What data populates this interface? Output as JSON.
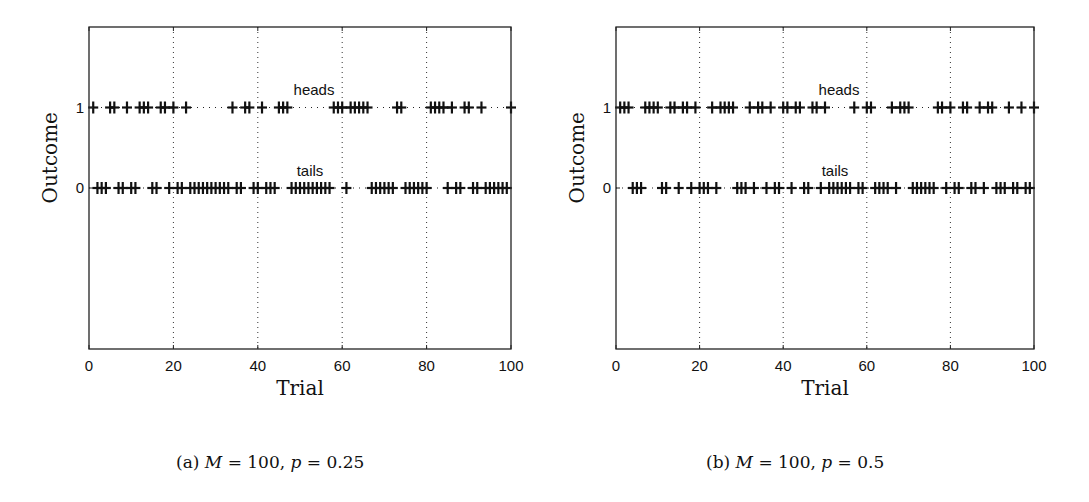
{
  "chart_data": [
    {
      "type": "scatter",
      "panel": "a",
      "caption_prefix": "(a)",
      "caption_M": "M = 100,",
      "caption_p": "p = 0.25",
      "xlabel": "Trial",
      "ylabel": "Outcome",
      "xlim": [
        0,
        100
      ],
      "ylim": [
        -2,
        2
      ],
      "xticks": [
        0,
        20,
        40,
        60,
        80,
        100
      ],
      "yticks": [
        0,
        1
      ],
      "grid": "vertical dotted at x ticks",
      "marker": "+",
      "row_labels": {
        "heads": "heads",
        "tails": "tails"
      },
      "series": [
        {
          "name": "heads",
          "y": 1,
          "x": [
            1,
            5,
            6,
            9,
            12,
            13,
            14,
            17,
            18,
            20,
            23,
            34,
            37,
            38,
            41,
            45,
            46,
            47,
            58,
            59,
            60,
            62,
            63,
            64,
            65,
            66,
            73,
            74,
            81,
            82,
            83,
            84,
            86,
            89,
            90,
            93,
            100
          ]
        },
        {
          "name": "tails",
          "y": 0,
          "x": [
            2,
            3,
            4,
            7,
            8,
            10,
            11,
            15,
            16,
            19,
            21,
            22,
            24,
            25,
            26,
            27,
            28,
            29,
            30,
            31,
            32,
            33,
            35,
            36,
            39,
            40,
            42,
            43,
            44,
            48,
            49,
            50,
            51,
            52,
            53,
            54,
            55,
            56,
            57,
            61,
            67,
            68,
            69,
            70,
            71,
            72,
            75,
            76,
            77,
            78,
            79,
            80,
            85,
            87,
            88,
            91,
            92,
            94,
            95,
            96,
            97,
            98,
            99
          ]
        }
      ]
    },
    {
      "type": "scatter",
      "panel": "b",
      "caption_prefix": "(b)",
      "caption_M": "M = 100,",
      "caption_p": "p = 0.5",
      "xlabel": "Trial",
      "ylabel": "Outcome",
      "xlim": [
        0,
        100
      ],
      "ylim": [
        -2,
        2
      ],
      "xticks": [
        0,
        20,
        40,
        60,
        80,
        100
      ],
      "yticks": [
        0,
        1
      ],
      "grid": "vertical dotted at x ticks",
      "marker": "+",
      "row_labels": {
        "heads": "heads",
        "tails": "tails"
      },
      "series": [
        {
          "name": "heads",
          "y": 1,
          "x": [
            1,
            2,
            3,
            7,
            8,
            9,
            10,
            13,
            14,
            16,
            17,
            19,
            23,
            25,
            26,
            27,
            28,
            32,
            34,
            35,
            37,
            40,
            41,
            43,
            44,
            47,
            48,
            50,
            57,
            60,
            61,
            66,
            68,
            69,
            70,
            77,
            78,
            80,
            83,
            84,
            87,
            89,
            90,
            94,
            97,
            100
          ]
        },
        {
          "name": "tails",
          "y": 0,
          "x": [
            4,
            5,
            6,
            11,
            12,
            15,
            18,
            20,
            21,
            22,
            24,
            29,
            30,
            31,
            33,
            36,
            38,
            39,
            42,
            45,
            46,
            49,
            51,
            52,
            53,
            54,
            55,
            56,
            58,
            59,
            62,
            63,
            64,
            65,
            67,
            71,
            72,
            73,
            74,
            75,
            76,
            79,
            81,
            82,
            85,
            86,
            88,
            91,
            92,
            93,
            95,
            96,
            98,
            99
          ]
        }
      ]
    }
  ],
  "captions": {
    "a": {
      "prefix": "(a)",
      "m_var": "M",
      "m_val": " = 100, ",
      "p_var": "p",
      "p_val": " = 0.25"
    },
    "b": {
      "prefix": "(b)",
      "m_var": "M",
      "m_val": " = 100, ",
      "p_var": "p",
      "p_val": " = 0.5"
    }
  }
}
